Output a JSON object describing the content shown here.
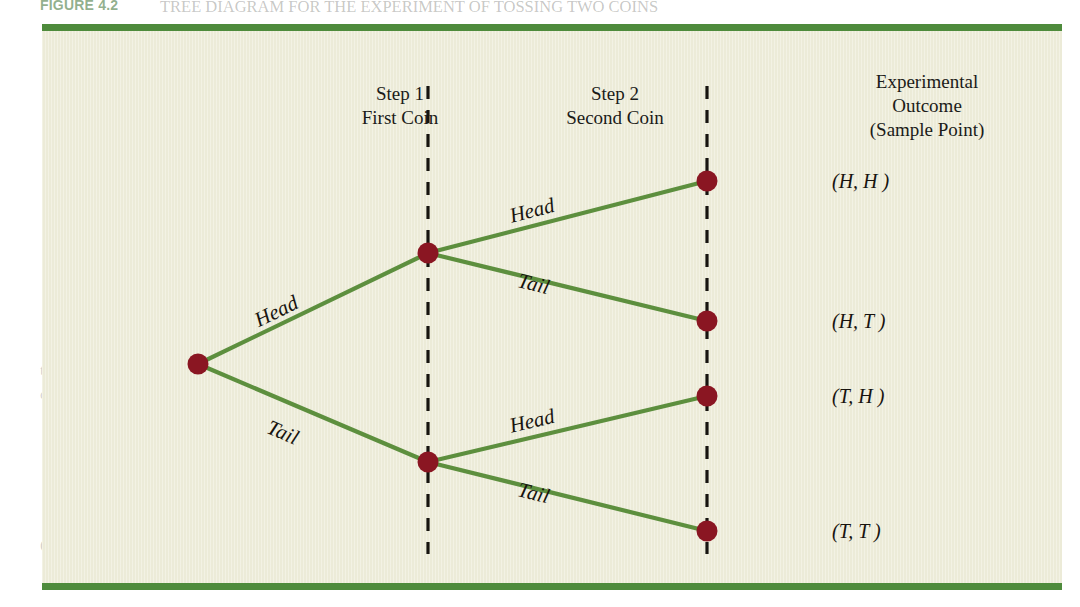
{
  "figure": {
    "figure_number": "FIGURE 4.2",
    "caption": "TREE DIAGRAM FOR THE EXPERIMENT OF TOSSING TWO COINS",
    "panel_color": "#eeedda",
    "rule_color": "#4e8b3c",
    "branch_color": "#5d8f3e",
    "node_color": "#8a1622",
    "divider_color": "#17140f"
  },
  "headers": {
    "step1_line1": "Step 1",
    "step1_line2": "First Coin",
    "step2_line1": "Step 2",
    "step2_line2": "Second Coin",
    "outcome_line1": "Experimental",
    "outcome_line2": "Outcome",
    "outcome_line3": "(Sample Point)"
  },
  "branch_labels": {
    "first_head": "Head",
    "first_tail": "Tail",
    "second_head_upper": "Head",
    "second_tail_upper": "Tail",
    "second_head_lower": "Head",
    "second_tail_lower": "Tail"
  },
  "outcomes": [
    "(H, H )",
    "(H, T )",
    "(T, H )",
    "(T, T )"
  ],
  "bleed_text": {
    "line1": "to list the sample points, we can use the tree diagram shown in Figure 4.2.",
    "line2": "The sequence of steps moves from left to right through the tree. Step 1 corresponds to tossing the first",
    "line3": "coin, and step 2 corresponds to tossing the second coin. For each possible outcome at step 1 we draw two",
    "line4": "line segments extending out to the right. The upper line segment represents the outcome head, and the",
    "line5": "lower line segment represents the outcome tail. For step 2 of the experiment we follow each branch of the",
    "line6": "tree and again draw two line segments, one representing the outcome head and one representing the out-",
    "line7": "come tail. The four sample points are:",
    "line8": "S = {(H, H ), (H, T ), (T, H ), (T, T )}",
    "heading": "Counting Rules, Combinations, and Permutations"
  }
}
